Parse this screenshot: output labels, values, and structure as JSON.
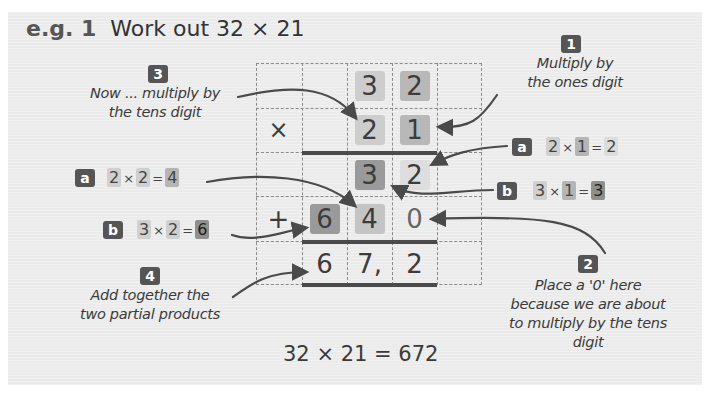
{
  "title": {
    "prefix": "e.g. 1",
    "text": "Work out  32 × 21"
  },
  "grid": {
    "rows": [
      [
        "",
        "",
        "3",
        "2",
        ""
      ],
      [
        "×",
        "",
        "2",
        "1",
        ""
      ],
      [
        "",
        "",
        "3",
        "2",
        ""
      ],
      [
        "+",
        "6",
        "4",
        "0",
        ""
      ],
      [
        "",
        "6",
        "7,",
        "2",
        ""
      ]
    ]
  },
  "steps": {
    "step1": {
      "badge": "1",
      "line1": "Multiply by",
      "line2": "the ones digit"
    },
    "step1a": {
      "badge": "a",
      "lhs1": "2",
      "op": "×",
      "lhs2": "1",
      "eq": "=",
      "rhs": "2"
    },
    "step1b": {
      "badge": "b",
      "lhs1": "3",
      "op": "×",
      "lhs2": "1",
      "eq": "=",
      "rhs": "3"
    },
    "step2": {
      "badge": "2",
      "line1": "Place a '0' here",
      "line2": "because we are about",
      "line3": "to multiply by the tens",
      "line4": "digit"
    },
    "step3": {
      "badge": "3",
      "line1": "Now ... multiply by",
      "line2": "the tens digit"
    },
    "step3a": {
      "badge": "a",
      "lhs1": "2",
      "op": "×",
      "lhs2": "2",
      "eq": "=",
      "rhs": "4"
    },
    "step3b": {
      "badge": "b",
      "lhs1": "3",
      "op": "×",
      "lhs2": "2",
      "eq": "=",
      "rhs": "6"
    },
    "step4": {
      "badge": "4",
      "line1": "Add together the",
      "line2": "two partial products"
    }
  },
  "result": "32 × 21 = 672"
}
